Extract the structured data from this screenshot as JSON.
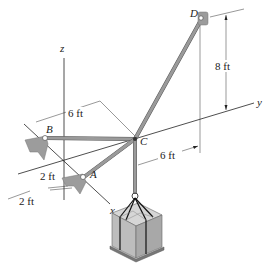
{
  "figure": {
    "axes": {
      "x": "x",
      "y": "y",
      "z": "z"
    },
    "points": {
      "A": "A",
      "B": "B",
      "C": "C",
      "D": "D"
    },
    "dimensions": {
      "dim_6ft_top": "6 ft",
      "dim_6ft_bottom": "6 ft",
      "dim_8ft": "8 ft",
      "dim_2ft_upper": "2 ft",
      "dim_2ft_lower": "2 ft"
    },
    "colors": {
      "cable": "#9a9a9a",
      "crate_top": "#d6d6d6",
      "crate_side": "#a8a8a8",
      "bracket": "#9c9c9c",
      "axis": "#222222"
    }
  }
}
